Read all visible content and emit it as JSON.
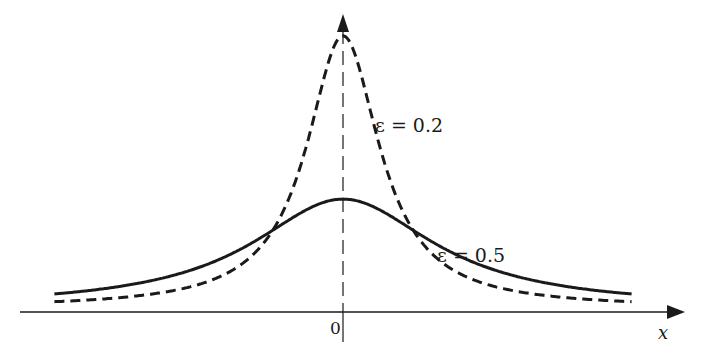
{
  "chart_data": {
    "type": "line",
    "title": "",
    "xlabel": "x",
    "ylabel": "",
    "x_tick_labels": [
      "0"
    ],
    "grid": false,
    "legend": null,
    "annotations": [
      {
        "text": "ε = 0.2",
        "series": "ε = 0.2",
        "position": "right of peak"
      },
      {
        "text": "ε = 0.5",
        "series": "ε = 0.5",
        "position": "right shoulder"
      }
    ],
    "function_form": "ε / (π (x² + ε²))",
    "xlim": [
      -1.3,
      1.3
    ],
    "series": [
      {
        "name": "ε = 0.2",
        "style": "dashed",
        "epsilon": 0.2,
        "x": [
          -1.3,
          -1.0,
          -0.8,
          -0.6,
          -0.4,
          -0.3,
          -0.2,
          -0.1,
          0.0,
          0.1,
          0.2,
          0.3,
          0.4,
          0.6,
          0.8,
          1.0,
          1.3
        ],
        "values": [
          0.037,
          0.061,
          0.094,
          0.159,
          0.318,
          0.49,
          0.796,
          1.273,
          1.592,
          1.273,
          0.796,
          0.49,
          0.318,
          0.159,
          0.094,
          0.061,
          0.037
        ]
      },
      {
        "name": "ε = 0.5",
        "style": "solid",
        "epsilon": 0.5,
        "x": [
          -1.3,
          -1.0,
          -0.8,
          -0.6,
          -0.4,
          -0.3,
          -0.2,
          -0.1,
          0.0,
          0.1,
          0.2,
          0.3,
          0.4,
          0.6,
          0.8,
          1.0,
          1.3
        ],
        "values": [
          0.082,
          0.127,
          0.178,
          0.261,
          0.388,
          0.468,
          0.549,
          0.612,
          0.637,
          0.612,
          0.549,
          0.468,
          0.388,
          0.261,
          0.178,
          0.127,
          0.082
        ]
      }
    ]
  },
  "labels": {
    "curve_a": "ε = 0.2",
    "curve_b": "ε = 0.5",
    "origin": "0",
    "x_axis": "x"
  },
  "colors": {
    "ink": "#1a1a1a",
    "background": "#ffffff"
  }
}
